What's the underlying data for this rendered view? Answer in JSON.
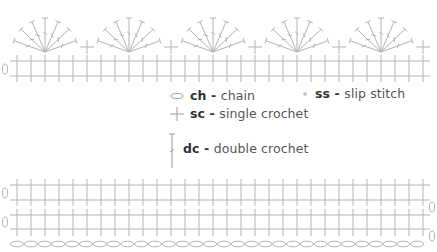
{
  "diagram": {
    "type": "crochet-stitch-chart",
    "stroke_color": "#b3b3b3",
    "top_section": {
      "fan_count": 5,
      "dc_per_fan": 7,
      "sc_between_fans": true,
      "base_rows": 1,
      "stitches_per_row": 30,
      "turning_chain_label": "0"
    },
    "bottom_section": {
      "sc_rows": 2,
      "stitches_per_row": 30,
      "foundation_chain_count": 30,
      "turning_chain_label": "0"
    }
  },
  "legend": {
    "ch": {
      "abbr": "ch",
      "sep": " - ",
      "label": "chain",
      "icon": "oval-chain-icon"
    },
    "sc": {
      "abbr": "sc",
      "sep": " - ",
      "label": "single crochet",
      "icon": "cross-sc-icon"
    },
    "dc": {
      "abbr": "dc",
      "sep": " - ",
      "label": "double crochet",
      "icon": "tall-dc-icon"
    },
    "ss": {
      "abbr": "ss",
      "sep": " - ",
      "label": "slip stitch",
      "icon": "dot-ss-icon"
    }
  }
}
